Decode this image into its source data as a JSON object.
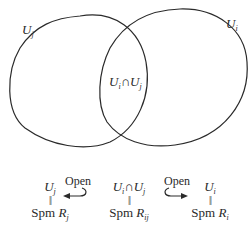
{
  "diagram": {
    "regions": {
      "left_set": {
        "label": "U",
        "sub": "j"
      },
      "right_set": {
        "label": "U",
        "sub": "i"
      },
      "intersection": {
        "label_a": "U",
        "sub_a": "i",
        "op": "∩",
        "label_b": "U",
        "sub_b": "j"
      }
    },
    "bottom": {
      "left": {
        "top": "U",
        "top_sub": "j",
        "eq": "||",
        "spm": "Spm",
        "ring": "R",
        "ring_sub": "j"
      },
      "middle": {
        "top_a": "U",
        "top_a_sub": "i",
        "op": "∩",
        "top_b": "U",
        "top_b_sub": "j",
        "eq": "||",
        "spm": "Spm",
        "ring": "R",
        "ring_sub": "ij"
      },
      "right": {
        "top": "U",
        "top_sub": "i",
        "eq": "||",
        "spm": "Spm",
        "ring": "R",
        "ring_sub": "i"
      },
      "arrow_left_label": "Open",
      "arrow_right_label": "Open"
    },
    "colors": {
      "stroke": "#2a2a2a",
      "background": "#ffffff"
    }
  }
}
